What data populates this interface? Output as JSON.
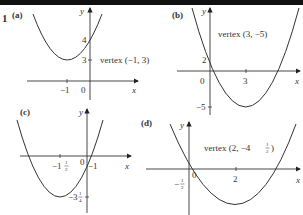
{
  "problem_number": "1",
  "graphs": [
    {
      "id": "a",
      "part_label": "(a)",
      "y_axis_label": "y",
      "x_axis_label": "x",
      "x_ticks": [
        "−1",
        "0"
      ],
      "y_ticks": [
        "4",
        "3"
      ],
      "annotation": "vertex (−1, 3)"
    },
    {
      "id": "b",
      "part_label": "(b)",
      "y_axis_label": "y",
      "x_axis_label": "x",
      "x_ticks": [
        "0",
        "3"
      ],
      "y_ticks": [
        "2",
        "−5"
      ],
      "annotation": "vertex (3, −5)"
    },
    {
      "id": "c",
      "part_label": "(c)",
      "y_axis_label": "y",
      "x_axis_label": "x",
      "x_ticks": [
        "−1½",
        "0",
        "−1"
      ],
      "x_tick_parts": {
        "whole": "−1",
        "num": "1",
        "den": "2"
      },
      "y_tick_parts": {
        "whole": "−3",
        "num": "1",
        "den": "4"
      },
      "annotation": ""
    },
    {
      "id": "d",
      "part_label": "(d)",
      "y_axis_label": "y",
      "x_axis_label": "x",
      "x_ticks": [
        "0",
        "2"
      ],
      "y_tick_parts": {
        "whole": "−",
        "num": "1",
        "den": "2"
      },
      "annotation_prefix": "vertex (2, −4",
      "annotation_frac": {
        "num": "1",
        "den": "2"
      },
      "annotation_suffix": ")"
    }
  ]
}
